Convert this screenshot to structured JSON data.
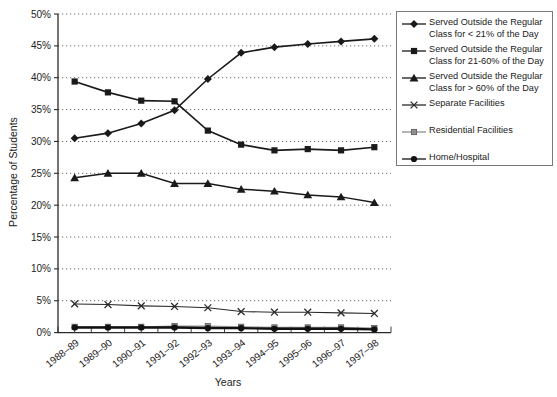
{
  "chart_data": {
    "type": "line",
    "title": "",
    "xlabel": "Years",
    "ylabel": "Percentage of Students",
    "ylim": [
      0,
      50
    ],
    "ytick_step": 5,
    "ytick_labels": [
      "0%",
      "5%",
      "10%",
      "15%",
      "20%",
      "25%",
      "30%",
      "35%",
      "40%",
      "45%",
      "50%"
    ],
    "grid": "horizontal-dotted",
    "legend_position": "top-right",
    "categories": [
      "1988–89",
      "1989–90",
      "1990–91",
      "1991–92",
      "1992–93",
      "1993–94",
      "1994–95",
      "1995–96",
      "1996–97",
      "1997–98"
    ],
    "series": [
      {
        "name": "Served Outside the Regular Class for < 21% of the Day",
        "marker": "diamond",
        "color": "#1a1a1a",
        "line_width": 1.6,
        "values": [
          30.5,
          31.3,
          32.8,
          34.9,
          39.8,
          43.9,
          44.8,
          45.3,
          45.7,
          46.1
        ]
      },
      {
        "name": "Served Outside the Regular Class for 21-60% of the Day",
        "marker": "square",
        "color": "#1a1a1a",
        "line_width": 1.6,
        "values": [
          39.4,
          37.7,
          36.4,
          36.3,
          31.7,
          29.5,
          28.6,
          28.8,
          28.6,
          29.1
        ]
      },
      {
        "name": "Served Outside the Regular Class for > 60% of the Day",
        "marker": "triangle",
        "color": "#1a1a1a",
        "line_width": 1.5,
        "values": [
          24.3,
          25.0,
          25.0,
          23.4,
          23.4,
          22.5,
          22.2,
          21.6,
          21.3,
          20.4
        ]
      },
      {
        "name": "Separate Facilities",
        "marker": "x",
        "color": "#2a2a2a",
        "line_width": 1.1,
        "values": [
          4.5,
          4.4,
          4.2,
          4.1,
          3.9,
          3.3,
          3.2,
          3.2,
          3.1,
          3.0
        ]
      },
      {
        "name": "Residential Facilities",
        "marker": "square-small",
        "color": "#8f8f8f",
        "line_width": 1.3,
        "values": [
          0.9,
          0.9,
          0.9,
          1.0,
          1.0,
          0.9,
          0.8,
          0.8,
          0.8,
          0.7
        ]
      },
      {
        "name": "Home/Hospital",
        "marker": "circle",
        "color": "#111111",
        "line_width": 2.4,
        "values": [
          0.8,
          0.8,
          0.8,
          0.8,
          0.7,
          0.7,
          0.6,
          0.6,
          0.6,
          0.5
        ]
      }
    ]
  },
  "axis_colors": {
    "axis": "#2b2b2b",
    "grid": "#555555",
    "tick_text": "#222222"
  }
}
